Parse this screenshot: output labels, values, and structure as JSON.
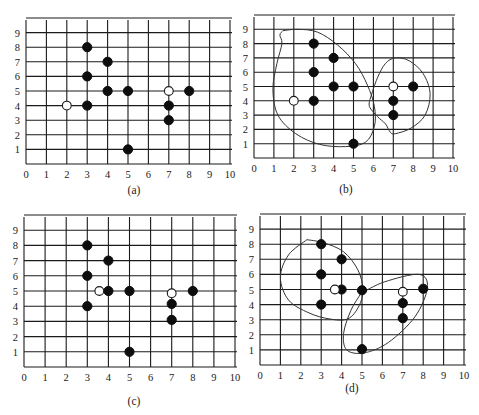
{
  "figure": {
    "point_colors": {
      "data_point": "#0d0d0d",
      "centroid": "#ffffff",
      "grid": "#1a1a1a",
      "outline": "#333333"
    },
    "x_ticks": [
      "0",
      "1",
      "2",
      "3",
      "4",
      "5",
      "6",
      "7",
      "8",
      "9",
      "10"
    ],
    "y_ticks": [
      "1",
      "2",
      "3",
      "4",
      "5",
      "6",
      "7",
      "8",
      "9"
    ]
  },
  "chart_data": [
    {
      "type": "scatter",
      "title": "(a)",
      "xlim": [
        0,
        10
      ],
      "ylim": [
        0,
        10
      ],
      "grid": true,
      "data_points": [
        [
          3,
          8
        ],
        [
          3,
          6
        ],
        [
          3,
          4
        ],
        [
          4,
          7
        ],
        [
          4,
          5
        ],
        [
          5,
          5
        ],
        [
          5,
          1
        ],
        [
          7,
          4
        ],
        [
          7,
          3
        ],
        [
          8,
          5
        ]
      ],
      "centroids": [
        [
          2,
          4
        ],
        [
          7,
          5
        ]
      ],
      "clusters": []
    },
    {
      "type": "scatter",
      "title": "(b)",
      "xlim": [
        0,
        10
      ],
      "ylim": [
        0,
        10
      ],
      "grid": true,
      "data_points": [
        [
          3,
          8
        ],
        [
          3,
          6
        ],
        [
          3,
          4
        ],
        [
          4,
          7
        ],
        [
          4,
          5
        ],
        [
          5,
          5
        ],
        [
          5,
          1
        ],
        [
          7,
          4
        ],
        [
          7,
          3
        ],
        [
          8,
          5
        ]
      ],
      "centroids": [
        [
          2,
          4
        ],
        [
          7,
          5
        ]
      ],
      "clusters": [
        [
          [
            1.45,
            8.9
          ],
          [
            2.2,
            9.0
          ],
          [
            3.2,
            8.8
          ],
          [
            4.2,
            7.9
          ],
          [
            5.1,
            6.6
          ],
          [
            5.7,
            5.1
          ],
          [
            6.05,
            3.6
          ],
          [
            6.05,
            2.2
          ],
          [
            5.6,
            1.1
          ],
          [
            4.6,
            0.8
          ],
          [
            3.3,
            0.95
          ],
          [
            2.1,
            1.7
          ],
          [
            1.2,
            3.0
          ],
          [
            0.95,
            4.8
          ],
          [
            1.15,
            6.6
          ],
          [
            1.4,
            8.0
          ],
          [
            1.3,
            8.6
          ],
          [
            1.45,
            8.9
          ]
        ],
        [
          [
            5.85,
            4.2
          ],
          [
            6.2,
            5.6
          ],
          [
            6.6,
            6.6
          ],
          [
            7.1,
            7.0
          ],
          [
            7.8,
            6.8
          ],
          [
            8.5,
            5.9
          ],
          [
            8.85,
            4.5
          ],
          [
            8.6,
            3.0
          ],
          [
            7.9,
            2.1
          ],
          [
            7.1,
            1.7
          ],
          [
            6.85,
            1.8
          ],
          [
            6.6,
            2.4
          ],
          [
            6.2,
            2.9
          ],
          [
            5.8,
            3.6
          ],
          [
            5.85,
            4.2
          ]
        ]
      ]
    },
    {
      "type": "scatter",
      "title": "(c)",
      "xlim": [
        0,
        10
      ],
      "ylim": [
        0,
        10
      ],
      "grid": true,
      "data_points": [
        [
          3,
          8
        ],
        [
          3,
          6
        ],
        [
          3,
          4
        ],
        [
          4,
          7
        ],
        [
          4,
          5
        ],
        [
          5,
          5
        ],
        [
          5,
          1
        ],
        [
          7,
          4.15
        ],
        [
          7,
          3.1
        ],
        [
          8,
          5
        ]
      ],
      "centroids": [
        [
          3.57,
          5
        ],
        [
          7,
          4.85
        ]
      ],
      "clusters": []
    },
    {
      "type": "scatter",
      "title": "(d)",
      "xlim": [
        0,
        10
      ],
      "ylim": [
        0,
        10
      ],
      "grid": true,
      "data_points": [
        [
          3,
          8
        ],
        [
          3,
          6
        ],
        [
          3,
          4
        ],
        [
          4,
          7
        ],
        [
          4,
          5
        ],
        [
          5,
          4.95
        ],
        [
          5,
          1.05
        ],
        [
          7,
          4.1
        ],
        [
          7,
          3.1
        ],
        [
          8,
          5.05
        ]
      ],
      "centroids": [
        [
          3.67,
          5
        ],
        [
          7,
          4.85
        ]
      ],
      "clusters": [
        [
          [
            2.3,
            8.3
          ],
          [
            3.1,
            8.1
          ],
          [
            4.1,
            7.5
          ],
          [
            4.8,
            6.3
          ],
          [
            5.05,
            5.0
          ],
          [
            4.85,
            3.9
          ],
          [
            4.3,
            3.05
          ],
          [
            3.4,
            3.05
          ],
          [
            2.4,
            3.45
          ],
          [
            1.4,
            4.3
          ],
          [
            1.0,
            5.8
          ],
          [
            1.4,
            7.3
          ],
          [
            2.3,
            8.3
          ]
        ],
        [
          [
            4.95,
            4.75
          ],
          [
            6.1,
            5.5
          ],
          [
            7.8,
            6.0
          ],
          [
            8.2,
            5.1
          ],
          [
            7.6,
            3.2
          ],
          [
            6.3,
            1.5
          ],
          [
            5.1,
            0.8
          ],
          [
            4.25,
            1.0
          ],
          [
            4.1,
            2.1
          ],
          [
            4.45,
            3.6
          ],
          [
            4.95,
            4.75
          ]
        ]
      ]
    }
  ]
}
